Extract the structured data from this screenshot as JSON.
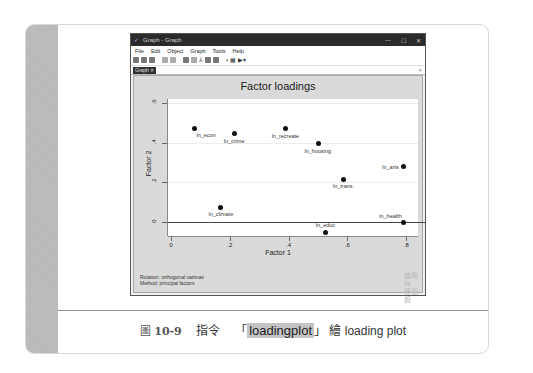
{
  "window": {
    "title": "Graph - Graph",
    "controls": [
      "—",
      "☐",
      "✕"
    ],
    "menu": [
      "File",
      "Edit",
      "Object",
      "Graph",
      "Tools",
      "Help"
    ],
    "toolbar_icons": [
      "open-icon",
      "save-icon",
      "print-icon",
      "copy-icon",
      "paste-icon",
      "graph-editor-icon",
      "rename-icon",
      "recorder-icon",
      "pointer-icon",
      "text-icon",
      "line-icon",
      "marker-icon",
      "play-icon"
    ],
    "tab": "Graph ✕",
    "tab_menu": "▾"
  },
  "graph": {
    "title": "Factor loadings",
    "note_lines": [
      "Rotation: orthogonal varimax",
      "Method: principal factors"
    ],
    "watermark_lines": [
      "啟用 W",
      "移至 設"
    ]
  },
  "chart_data": {
    "type": "scatter",
    "title": "Factor loadings",
    "xlabel": "Factor 1",
    "ylabel": "Factor 2",
    "xlim": [
      -0.01,
      0.84
    ],
    "ylim": [
      -0.07,
      0.62
    ],
    "x_ticks": [
      "0",
      ".2",
      ".4",
      ".6",
      ".8"
    ],
    "x_tick_values": [
      0,
      0.2,
      0.4,
      0.6,
      0.8
    ],
    "y_ticks": [
      "0",
      ".2",
      ".4",
      ".6"
    ],
    "y_tick_values": [
      0,
      0.2,
      0.4,
      0.6
    ],
    "grid": true,
    "reference_line_y": 0,
    "points": [
      {
        "label": "ln_econ",
        "x": 0.08,
        "y": 0.47,
        "label_pos": "below-right"
      },
      {
        "label": "ln_crime",
        "x": 0.215,
        "y": 0.445,
        "label_pos": "below"
      },
      {
        "label": "ln_recreate",
        "x": 0.39,
        "y": 0.47,
        "label_pos": "below"
      },
      {
        "label": "ln_housing",
        "x": 0.5,
        "y": 0.395,
        "label_pos": "below"
      },
      {
        "label": "ln_arts",
        "x": 0.79,
        "y": 0.28,
        "label_pos": "left"
      },
      {
        "label": "ln_trans",
        "x": 0.585,
        "y": 0.215,
        "label_pos": "below"
      },
      {
        "label": "ln_climate",
        "x": 0.17,
        "y": 0.075,
        "label_pos": "below"
      },
      {
        "label": "ln_health",
        "x": 0.79,
        "y": 0.0,
        "label_pos": "above-left"
      },
      {
        "label": "ln_educ",
        "x": 0.525,
        "y": -0.05,
        "label_pos": "above"
      }
    ],
    "annotations": [
      "Rotation: orthogonal varimax",
      "Method: principal factors"
    ]
  },
  "caption": {
    "prefix": "圖",
    "number": "10-9",
    "text_before": "指令",
    "quote_open": "「",
    "command": "loadingplot",
    "quote_close": "」",
    "text_after": "繪 loading plot"
  }
}
